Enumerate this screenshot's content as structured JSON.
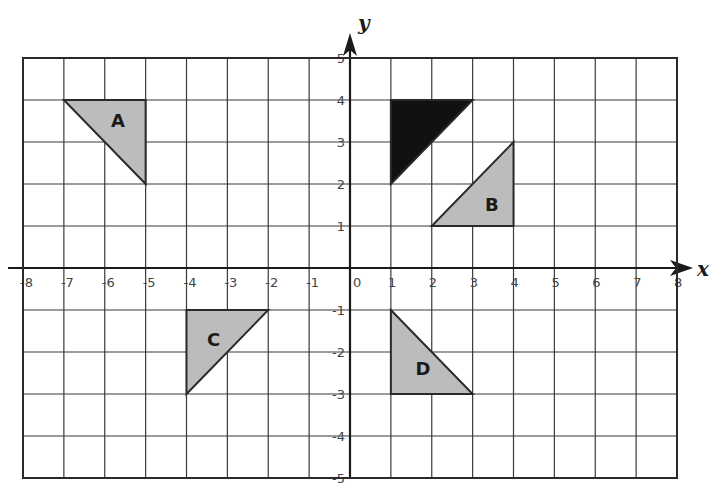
{
  "graph": {
    "x_axis_label": "x",
    "y_axis_label": "y",
    "x_range": [
      -8,
      8
    ],
    "y_range": [
      -5,
      5
    ],
    "x_ticks": [
      "-8",
      "-7",
      "-6",
      "-5",
      "-4",
      "-3",
      "-2",
      "-1",
      "0",
      "1",
      "2",
      "3",
      "4",
      "5",
      "6",
      "7",
      "8"
    ],
    "y_ticks": [
      "5",
      "4",
      "3",
      "2",
      "1",
      "-1",
      "-2",
      "-3",
      "-4",
      "-5"
    ],
    "colors": {
      "grid": "#3a3a3a",
      "shaded": "#bcbcbc",
      "preimage": "#111111"
    }
  },
  "shapes": [
    {
      "id": "preimage",
      "label": "",
      "fill": "#111111",
      "vertices": [
        [
          1,
          4
        ],
        [
          3,
          4
        ],
        [
          1,
          2
        ]
      ]
    },
    {
      "id": "A",
      "label": "A",
      "fill": "#bcbcbc",
      "vertices": [
        [
          -7,
          4
        ],
        [
          -5,
          4
        ],
        [
          -5,
          2
        ]
      ],
      "label_pos": [
        -5.85,
        3.35
      ]
    },
    {
      "id": "B",
      "label": "B",
      "fill": "#bcbcbc",
      "vertices": [
        [
          2,
          1
        ],
        [
          4,
          1
        ],
        [
          4,
          3
        ]
      ],
      "label_pos": [
        3.3,
        1.35
      ]
    },
    {
      "id": "C",
      "label": "C",
      "fill": "#bcbcbc",
      "vertices": [
        [
          -4,
          -1
        ],
        [
          -2,
          -1
        ],
        [
          -4,
          -3
        ]
      ],
      "label_pos": [
        -3.5,
        -1.85
      ]
    },
    {
      "id": "D",
      "label": "D",
      "fill": "#bcbcbc",
      "vertices": [
        [
          1,
          -1
        ],
        [
          1,
          -3
        ],
        [
          3,
          -3
        ]
      ],
      "label_pos": [
        1.6,
        -2.55
      ]
    }
  ]
}
